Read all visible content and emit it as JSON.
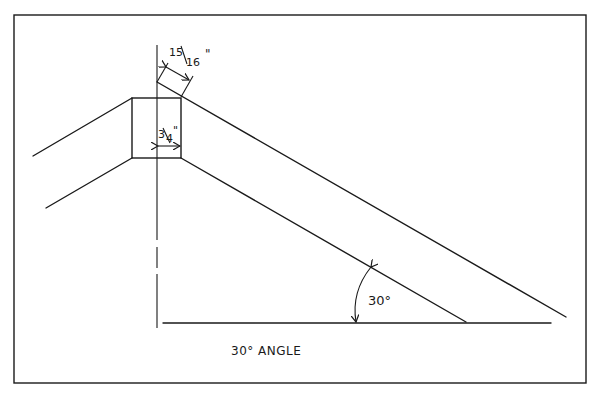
{
  "diagram": {
    "title": "30° ANGLE",
    "dimensions": {
      "rafter_depth_top": {
        "num": "15",
        "den": "16",
        "unit": "\""
      },
      "ridge_width": {
        "num": "3",
        "den": "4",
        "unit": "\""
      }
    },
    "angle_label": "30°",
    "colors": {
      "line": "#1a1a1a",
      "background": "#ffffff"
    }
  }
}
